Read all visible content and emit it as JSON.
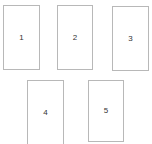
{
  "cards": [
    {
      "label": "1"
    },
    {
      "label": "2"
    },
    {
      "label": "3"
    },
    {
      "label": "4"
    },
    {
      "label": "5"
    }
  ],
  "colors": {
    "border": "#b8b8b8",
    "text": "#333333",
    "background": "#ffffff"
  }
}
